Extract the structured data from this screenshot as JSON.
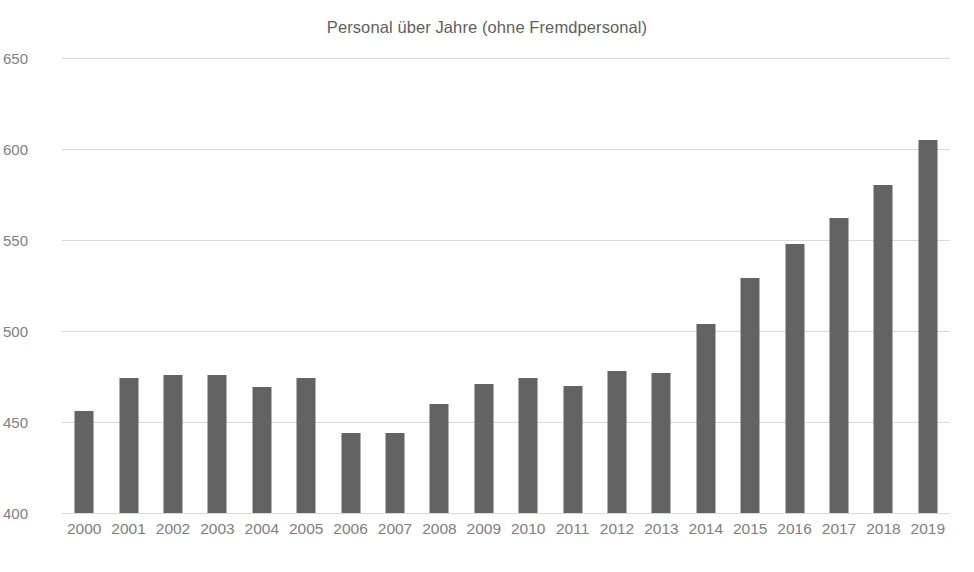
{
  "chart_data": {
    "type": "bar",
    "title": "Personal über Jahre (ohne Fremdpersonal)",
    "xlabel": "",
    "ylabel": "",
    "categories": [
      "2000",
      "2001",
      "2002",
      "2003",
      "2004",
      "2005",
      "2006",
      "2007",
      "2008",
      "2009",
      "2010",
      "2011",
      "2012",
      "2013",
      "2014",
      "2015",
      "2016",
      "2017",
      "2018",
      "2019"
    ],
    "values": [
      456,
      474,
      476,
      476,
      469,
      474,
      444,
      444,
      460,
      471,
      474,
      470,
      478,
      477,
      504,
      529,
      548,
      562,
      580,
      605
    ],
    "series": [
      {
        "name": "Personal",
        "values": [
          456,
          474,
          476,
          476,
          469,
          474,
          444,
          444,
          460,
          471,
          474,
          470,
          478,
          477,
          504,
          529,
          548,
          562,
          580,
          605
        ]
      }
    ],
    "ylim": [
      400,
      650
    ],
    "yticks": [
      400,
      450,
      500,
      550,
      600,
      650
    ],
    "ytick_labels": [
      "400",
      "450",
      "500",
      "550",
      "600",
      "650"
    ],
    "grid": true,
    "grid_axis": "y",
    "legend": false,
    "legend_position": "none",
    "bar_color": "#636363",
    "grid_color": "#d9d9d9",
    "text_color": "#808080",
    "title_color": "#606060",
    "background": "#ffffff"
  }
}
